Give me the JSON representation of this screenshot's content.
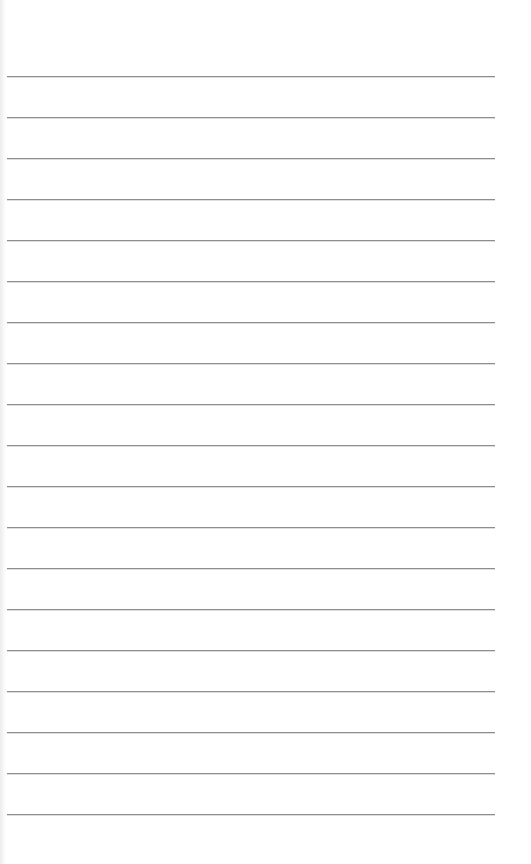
{
  "page": {
    "type": "lined-paper",
    "background_color": "#ffffff",
    "rule_color": "#8e8e8e",
    "rule_count": 19,
    "rule_left": 7,
    "rule_width": 488,
    "rule_positions_y": [
      76,
      117,
      158,
      199,
      240,
      281,
      322,
      363,
      404,
      445,
      486,
      527,
      568,
      609,
      650,
      691,
      732,
      773,
      814
    ]
  }
}
